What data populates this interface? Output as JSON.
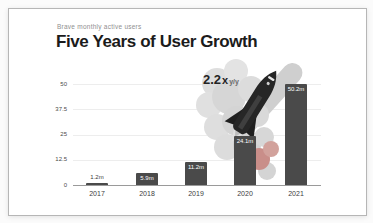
{
  "chart_data": {
    "type": "bar",
    "title": "Five Years of User Growth",
    "subtitle": "Brave monthly active users",
    "categories": [
      "2017",
      "2018",
      "2019",
      "2020",
      "2021"
    ],
    "values": [
      1.2,
      5.9,
      11.2,
      24.1,
      50.2
    ],
    "value_labels": [
      "1.2m",
      "5.9m",
      "11.2m",
      "24.1m",
      "50.2m"
    ],
    "ylim": [
      0,
      50
    ],
    "yticks": [
      0,
      12.5,
      25,
      37.5,
      50
    ],
    "ytick_labels": [
      "0",
      "12.5",
      "25",
      "37.5",
      "50"
    ],
    "grid": true,
    "legend": false,
    "annotation": {
      "multiplier": "2.2",
      "times_symbol": "x",
      "period": "y/y"
    },
    "bar_color": "#4a4a4a",
    "value_label_color_inside": "#ffffff",
    "value_label_color_outside": "#3a3a3a",
    "illustration_colors": {
      "smoke": "#d9d9d9",
      "ember": "#c98e89",
      "rocket": "#262626",
      "plume": "#cfcfcf"
    }
  }
}
